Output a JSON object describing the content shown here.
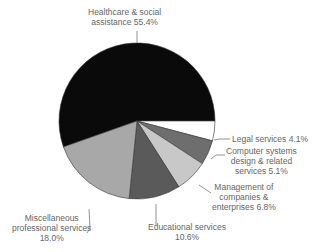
{
  "chart_data": {
    "type": "pie",
    "title": "",
    "categories": [
      "Healthcare & social assistance",
      "Legal services",
      "Computer systems design & related services",
      "Management of companies & enterprises",
      "Educational services",
      "Miscellaneous professional services"
    ],
    "values": [
      55.4,
      4.1,
      5.1,
      6.8,
      10.6,
      18.0
    ],
    "unit": "%",
    "colors": [
      "#0a0a0a",
      "#ffffff",
      "#6e6e6e",
      "#c8c8c8",
      "#5a5a5a",
      "#a8a8a8"
    ],
    "start_angle_deg": 0,
    "direction": "clockwise from 3 o'clock for small slices",
    "legend": "none (direct labels with leader lines)"
  },
  "labels": {
    "healthcare_1": "Healthcare & social",
    "healthcare_2": "assistance 55.4%",
    "legal": "Legal services 4.1%",
    "computer_1": "Computer systems",
    "computer_2": "design & related",
    "computer_3": "services 5.1%",
    "management_1": "Management of",
    "management_2": "companies &",
    "management_3": "enterprises 6.8%",
    "educational_1": "Educational services",
    "educational_2": "10.6%",
    "misc_1": "Miscellaneous",
    "misc_2": "professional services",
    "misc_3": "18.0%"
  }
}
